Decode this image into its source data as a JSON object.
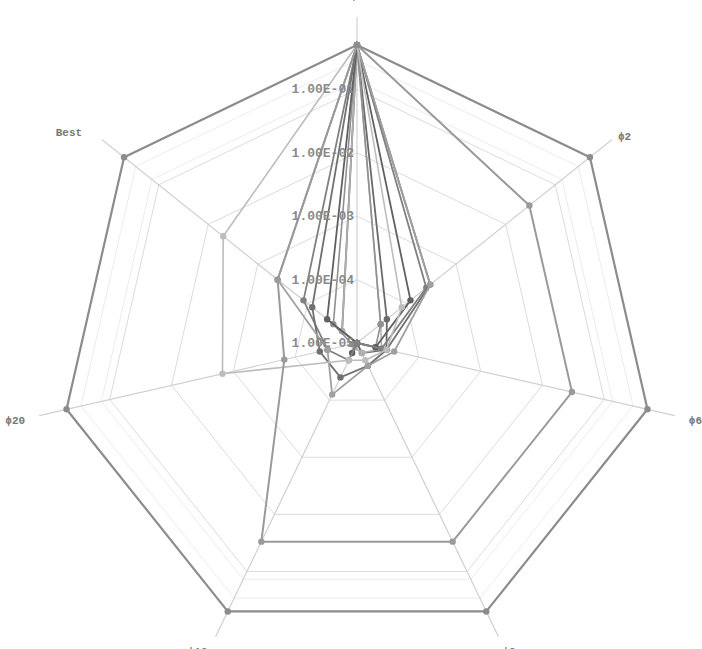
{
  "chart_data": {
    "type": "radar",
    "title": "",
    "scale": "log",
    "axes": [
      "ϕ1",
      "ϕ2",
      "ϕ6",
      "ϕ8",
      "ϕ10",
      "ϕ20",
      "Best"
    ],
    "tick_labels": [
      "1.00E-05",
      "1.00E-04",
      "1.00E-03",
      "1.00E-02",
      "1.00E-01"
    ],
    "tick_log_values": [
      -5,
      -4,
      -3,
      -2,
      -1
    ],
    "range_log": [
      -5.0,
      -0.3
    ],
    "grid": true,
    "legend": "none",
    "series": [
      {
        "name": "series-1",
        "color": "#8c8c8c",
        "width": 2.2,
        "values": [
          0.5,
          0.5,
          0.5,
          0.5,
          0.5,
          0.5,
          0.5
        ]
      },
      {
        "name": "series-2",
        "color": "#9a9a9a",
        "width": 2.0,
        "values": [
          0.5,
          0.03,
          0.03,
          0.03,
          0.03,
          0.00015,
          0.0004
        ]
      },
      {
        "name": "series-3",
        "color": "#bdbdbd",
        "width": 1.6,
        "values": [
          0.5,
          8e-05,
          3e-05,
          2e-05,
          2e-05,
          0.0015,
          0.005
        ]
      },
      {
        "name": "series-4",
        "color": "#a0a0a0",
        "width": 1.8,
        "values": [
          0.5,
          0.0003,
          4e-05,
          2.5e-05,
          8e-05,
          3e-05,
          0.0004
        ]
      },
      {
        "name": "series-5",
        "color": "#707070",
        "width": 1.8,
        "values": [
          0.5,
          0.0003,
          3e-05,
          2.5e-05,
          4e-05,
          4e-05,
          8e-05
        ]
      },
      {
        "name": "series-6",
        "color": "#808080",
        "width": 1.8,
        "values": [
          0.5,
          0.00025,
          2.5e-05,
          1e-05,
          2e-05,
          3e-05,
          0.00012
        ]
      },
      {
        "name": "series-7",
        "color": "#606060",
        "width": 1.8,
        "values": [
          0.5,
          0.00012,
          2e-05,
          1e-05,
          1.5e-05,
          1e-05,
          4e-05
        ]
      },
      {
        "name": "series-8",
        "color": "#909090",
        "width": 1.6,
        "values": [
          0.5,
          3e-05,
          2e-05,
          1e-05,
          1e-05,
          1.2e-05,
          3e-05
        ]
      },
      {
        "name": "series-9",
        "color": "#b0b0b0",
        "width": 1.6,
        "values": [
          0.5,
          3e-05,
          2.5e-05,
          1.5e-05,
          1.2e-05,
          1e-05,
          2e-05
        ]
      },
      {
        "name": "series-10",
        "color": "#6a6a6a",
        "width": 1.8,
        "values": [
          0.5,
          4e-05,
          3e-05,
          1.5e-05,
          1e-05,
          1e-05,
          2e-05
        ]
      }
    ]
  }
}
